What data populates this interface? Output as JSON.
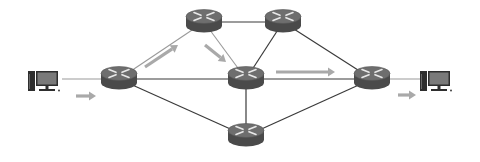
{
  "diagram": {
    "type": "network-topology",
    "colors": {
      "background": "#ffffff",
      "link_dark": "#3a3a3a",
      "link_light": "#9a9a9a",
      "router_body": "#4a4a4a",
      "router_top": "#6e6e6e",
      "router_arrows": "#e8e8e8",
      "flow_arrow": "#a9a9a9",
      "pc_body": "#2e2e2e",
      "pc_screen": "#7a7a7a"
    },
    "nodes": [
      {
        "id": "pc-src",
        "kind": "pc",
        "label": "source-host"
      },
      {
        "id": "r1",
        "kind": "router",
        "label": "router-left"
      },
      {
        "id": "r2",
        "kind": "router",
        "label": "router-top-left"
      },
      {
        "id": "r3",
        "kind": "router",
        "label": "router-top-right"
      },
      {
        "id": "r4",
        "kind": "router",
        "label": "router-center"
      },
      {
        "id": "r5",
        "kind": "router",
        "label": "router-right"
      },
      {
        "id": "r6",
        "kind": "router",
        "label": "router-bottom"
      },
      {
        "id": "pc-dst",
        "kind": "pc",
        "label": "destination-host"
      }
    ],
    "links": [
      {
        "from": "pc-src",
        "to": "r1",
        "style": "light"
      },
      {
        "from": "r1",
        "to": "r2",
        "style": "light"
      },
      {
        "from": "r1",
        "to": "r4",
        "style": "dark"
      },
      {
        "from": "r1",
        "to": "r6",
        "style": "dark"
      },
      {
        "from": "r2",
        "to": "r3",
        "style": "dark"
      },
      {
        "from": "r2",
        "to": "r4",
        "style": "light"
      },
      {
        "from": "r3",
        "to": "r4",
        "style": "dark"
      },
      {
        "from": "r3",
        "to": "r5",
        "style": "dark"
      },
      {
        "from": "r4",
        "to": "r5",
        "style": "dark"
      },
      {
        "from": "r4",
        "to": "r6",
        "style": "dark"
      },
      {
        "from": "r6",
        "to": "r5",
        "style": "dark"
      },
      {
        "from": "r5",
        "to": "pc-dst",
        "style": "light"
      }
    ],
    "flow_arrows": [
      {
        "id": "flow-into-r1",
        "along": [
          "pc-src",
          "r1"
        ]
      },
      {
        "id": "flow-r1-to-r2",
        "along": [
          "r1",
          "r2"
        ]
      },
      {
        "id": "flow-r2-to-r4",
        "along": [
          "r2",
          "r4"
        ]
      },
      {
        "id": "flow-r4-to-r5",
        "along": [
          "r4",
          "r5"
        ]
      },
      {
        "id": "flow-r5-to-dst",
        "along": [
          "r5",
          "pc-dst"
        ]
      }
    ]
  }
}
